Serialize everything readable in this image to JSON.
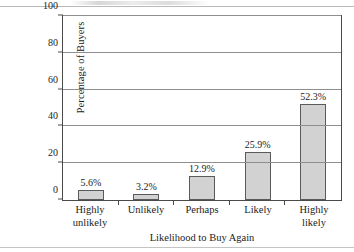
{
  "chart_data": {
    "type": "bar",
    "title": "",
    "xlabel": "Likelihood to Buy Again",
    "ylabel": "Percentage of Buyers",
    "categories": [
      "Highly unlikely",
      "Unlikely",
      "Perhaps",
      "Likely",
      "Highly likely"
    ],
    "category_lines": [
      [
        "Highly",
        "unlikely"
      ],
      [
        "Unlikely"
      ],
      [
        "Perhaps"
      ],
      [
        "Likely"
      ],
      [
        "Highly",
        "likely"
      ]
    ],
    "values": [
      5.6,
      3.2,
      12.9,
      25.9,
      52.3
    ],
    "value_labels": [
      "5.6%",
      "3.2%",
      "12.9%",
      "25.9%",
      "52.3%"
    ],
    "ylim": [
      0,
      100
    ],
    "ytick_values": [
      0,
      20,
      40,
      60,
      80,
      100
    ],
    "ytick_labels": [
      "0",
      "20",
      "40",
      "60",
      "80",
      "100"
    ],
    "grid": true,
    "grid_axis": "y",
    "legend": "none",
    "bar_fill_color": "#d2d2d2",
    "bar_border_color": "#5a5a5a",
    "axis_color": "#4a4a4a",
    "gridline_color": "#8e8e8e"
  }
}
